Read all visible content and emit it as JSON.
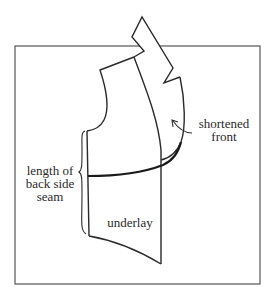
{
  "figure": {
    "type": "garment pattern diagram",
    "colors": {
      "stroke": "#2a2a2a",
      "frame": "#555555",
      "background": "#ffffff"
    }
  },
  "labels": {
    "shortened_front": {
      "line1": "shortened",
      "line2": "front"
    },
    "length_back_side_seam": {
      "line1": "length of",
      "line2": "back side",
      "line3": "seam"
    },
    "underlay": "underlay"
  }
}
